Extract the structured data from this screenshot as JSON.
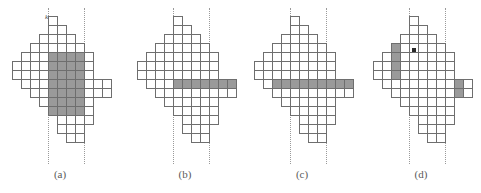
{
  "figure": {
    "cell_size": 9,
    "colors": {
      "cell_fill": "#ffffff",
      "cell_stroke": "#6e6e6e",
      "shaded_fill": "#9a9a9a",
      "guide_line": "#9a9a9a",
      "marker": "#2a2a2a",
      "caption_text": "#5a5a5a",
      "background": "#ffffff"
    },
    "panels": [
      {
        "id": "panel-a",
        "caption": "(a)",
        "left": 0,
        "origin_x": 12,
        "origin_y": 16,
        "guides": [
          {
            "name": "guide-left",
            "x": 48,
            "label": "k",
            "label_x": 45,
            "label_y": 14
          },
          {
            "name": "guide-right",
            "x": 84,
            "label": "h",
            "label_x": 78,
            "label_y": 53
          }
        ],
        "markers": [],
        "rows": [
          {
            "y": 0,
            "x0": 4,
            "n": 1,
            "shaded": []
          },
          {
            "y": 1,
            "x0": 4,
            "n": 2,
            "shaded": []
          },
          {
            "y": 2,
            "x0": 3,
            "n": 4,
            "shaded": []
          },
          {
            "y": 3,
            "x0": 2,
            "n": 6,
            "shaded": []
          },
          {
            "y": 4,
            "x0": 1,
            "n": 8,
            "shaded": [
              4,
              5,
              6,
              7
            ]
          },
          {
            "y": 5,
            "x0": 0,
            "n": 9,
            "shaded": [
              4,
              5,
              6,
              7
            ]
          },
          {
            "y": 6,
            "x0": 0,
            "n": 9,
            "shaded": [
              4,
              5,
              6,
              7
            ]
          },
          {
            "y": 7,
            "x0": 1,
            "n": 10,
            "shaded": [
              4,
              5,
              6,
              7
            ]
          },
          {
            "y": 8,
            "x0": 2,
            "n": 9,
            "shaded": [
              4,
              5,
              6,
              7
            ]
          },
          {
            "y": 9,
            "x0": 3,
            "n": 6,
            "shaded": [
              4,
              5,
              6,
              7
            ]
          },
          {
            "y": 10,
            "x0": 4,
            "n": 5,
            "shaded": [
              4,
              5,
              6,
              7
            ]
          },
          {
            "y": 11,
            "x0": 5,
            "n": 4,
            "shaded": []
          },
          {
            "y": 12,
            "x0": 5,
            "n": 3,
            "shaded": []
          },
          {
            "y": 13,
            "x0": 6,
            "n": 2,
            "shaded": []
          }
        ]
      },
      {
        "id": "panel-b",
        "caption": "(b)",
        "left": 125,
        "origin_x": 12,
        "origin_y": 16,
        "guides": [
          {
            "name": "guide-left",
            "x": 48,
            "label": "",
            "label_x": 45,
            "label_y": 14
          },
          {
            "name": "guide-right",
            "x": 84,
            "label": "",
            "label_x": 78,
            "label_y": 53
          }
        ],
        "markers": [],
        "rows": [
          {
            "y": 0,
            "x0": 4,
            "n": 1,
            "shaded": []
          },
          {
            "y": 1,
            "x0": 4,
            "n": 2,
            "shaded": []
          },
          {
            "y": 2,
            "x0": 3,
            "n": 4,
            "shaded": []
          },
          {
            "y": 3,
            "x0": 2,
            "n": 6,
            "shaded": []
          },
          {
            "y": 4,
            "x0": 1,
            "n": 8,
            "shaded": []
          },
          {
            "y": 5,
            "x0": 0,
            "n": 9,
            "shaded": []
          },
          {
            "y": 6,
            "x0": 0,
            "n": 9,
            "shaded": []
          },
          {
            "y": 7,
            "x0": 1,
            "n": 10,
            "shaded": [
              4,
              5,
              6,
              7,
              8,
              9,
              10
            ]
          },
          {
            "y": 8,
            "x0": 2,
            "n": 9,
            "shaded": []
          },
          {
            "y": 9,
            "x0": 3,
            "n": 6,
            "shaded": []
          },
          {
            "y": 10,
            "x0": 4,
            "n": 5,
            "shaded": []
          },
          {
            "y": 11,
            "x0": 5,
            "n": 4,
            "shaded": []
          },
          {
            "y": 12,
            "x0": 5,
            "n": 3,
            "shaded": []
          },
          {
            "y": 13,
            "x0": 6,
            "n": 2,
            "shaded": []
          }
        ]
      },
      {
        "id": "panel-c",
        "caption": "(c)",
        "left": 242,
        "origin_x": 12,
        "origin_y": 16,
        "guides": [
          {
            "name": "guide-left",
            "x": 48,
            "label": "",
            "label_x": 45,
            "label_y": 14
          },
          {
            "name": "guide-right",
            "x": 84,
            "label": "",
            "label_x": 78,
            "label_y": 53
          }
        ],
        "markers": [],
        "rows": [
          {
            "y": 0,
            "x0": 4,
            "n": 1,
            "shaded": []
          },
          {
            "y": 1,
            "x0": 4,
            "n": 2,
            "shaded": []
          },
          {
            "y": 2,
            "x0": 3,
            "n": 4,
            "shaded": []
          },
          {
            "y": 3,
            "x0": 2,
            "n": 6,
            "shaded": []
          },
          {
            "y": 4,
            "x0": 1,
            "n": 8,
            "shaded": []
          },
          {
            "y": 5,
            "x0": 0,
            "n": 9,
            "shaded": []
          },
          {
            "y": 6,
            "x0": 0,
            "n": 9,
            "shaded": []
          },
          {
            "y": 7,
            "x0": 1,
            "n": 10,
            "shaded": [
              2,
              3,
              4,
              5,
              6,
              7,
              8,
              9,
              10
            ]
          },
          {
            "y": 8,
            "x0": 2,
            "n": 9,
            "shaded": []
          },
          {
            "y": 9,
            "x0": 3,
            "n": 6,
            "shaded": []
          },
          {
            "y": 10,
            "x0": 4,
            "n": 5,
            "shaded": []
          },
          {
            "y": 11,
            "x0": 5,
            "n": 4,
            "shaded": []
          },
          {
            "y": 12,
            "x0": 5,
            "n": 3,
            "shaded": []
          },
          {
            "y": 13,
            "x0": 6,
            "n": 2,
            "shaded": []
          }
        ]
      },
      {
        "id": "panel-d",
        "caption": "(d)",
        "left": 361,
        "origin_x": 12,
        "origin_y": 16,
        "guides": [
          {
            "name": "guide-left",
            "x": 48,
            "label": "",
            "label_x": 45,
            "label_y": 14
          },
          {
            "name": "guide-right",
            "x": 84,
            "label": "",
            "label_x": 78,
            "label_y": 53
          }
        ],
        "markers": [
          {
            "name": "cell-marker",
            "x": 51,
            "y": 48
          }
        ],
        "rows": [
          {
            "y": 0,
            "x0": 4,
            "n": 1,
            "shaded": []
          },
          {
            "y": 1,
            "x0": 4,
            "n": 2,
            "shaded": []
          },
          {
            "y": 2,
            "x0": 3,
            "n": 4,
            "shaded": []
          },
          {
            "y": 3,
            "x0": 2,
            "n": 6,
            "shaded": [
              2
            ]
          },
          {
            "y": 4,
            "x0": 1,
            "n": 8,
            "shaded": [
              2
            ]
          },
          {
            "y": 5,
            "x0": 0,
            "n": 9,
            "shaded": [
              2
            ]
          },
          {
            "y": 6,
            "x0": 0,
            "n": 9,
            "shaded": [
              2
            ]
          },
          {
            "y": 7,
            "x0": 1,
            "n": 10,
            "shaded": [
              9
            ]
          },
          {
            "y": 8,
            "x0": 2,
            "n": 9,
            "shaded": [
              9
            ]
          },
          {
            "y": 9,
            "x0": 3,
            "n": 6,
            "shaded": []
          },
          {
            "y": 10,
            "x0": 4,
            "n": 5,
            "shaded": []
          },
          {
            "y": 11,
            "x0": 5,
            "n": 4,
            "shaded": []
          },
          {
            "y": 12,
            "x0": 5,
            "n": 3,
            "shaded": []
          },
          {
            "y": 13,
            "x0": 6,
            "n": 2,
            "shaded": []
          }
        ]
      }
    ]
  }
}
